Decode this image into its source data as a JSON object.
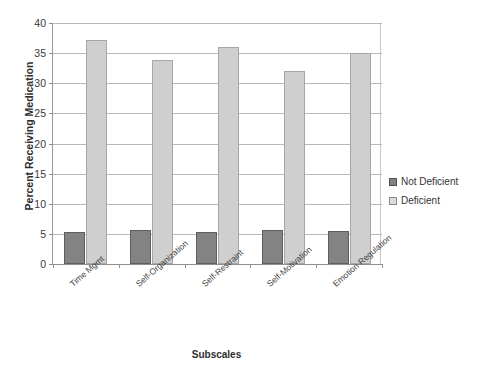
{
  "chart_data": {
    "type": "bar",
    "title": "",
    "xlabel": "Subscales",
    "ylabel": "Percent Receiving Medication",
    "ylim": [
      0,
      40
    ],
    "ytick_step": 5,
    "grid": true,
    "legend_position": "right",
    "categories": [
      "Time Mgmt",
      "Self-Organization",
      "Self-Restraint",
      "Self-Motivation",
      "Emotion Regulation"
    ],
    "ytick_labels": [
      "0",
      "5",
      "10",
      "15",
      "20",
      "25",
      "30",
      "35",
      "40"
    ],
    "series": [
      {
        "name": "Not Deficient",
        "color": "#838383",
        "values": [
          5.3,
          5.7,
          5.3,
          5.6,
          5.5
        ]
      },
      {
        "name": "Deficient",
        "color": "#cfcfcf",
        "values": [
          37.1,
          33.8,
          36.1,
          32.1,
          35.0
        ]
      }
    ]
  },
  "legend": {
    "items": [
      {
        "label": "Not Deficient"
      },
      {
        "label": "Deficient"
      }
    ]
  }
}
